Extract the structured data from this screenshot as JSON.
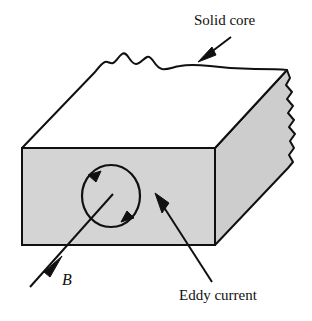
{
  "figure": {
    "name": "eddy-current-in-solid-core",
    "background_color": "#ffffff",
    "width": 312,
    "height": 321
  },
  "labels": {
    "solid_core": "Solid core",
    "eddy_current": "Eddy current",
    "b_field": "B"
  },
  "icons": {
    "solid_core_arrow": "arrow-down-left-icon",
    "eddy_current_arrow": "arrow-up-left-icon",
    "b_field_arrow": "arrow-up-right-icon",
    "eddy_loop_arrow_top": "arrowhead-counterclockwise-icon",
    "eddy_loop_arrow_bottom": "arrowhead-counterclockwise-icon"
  },
  "colors": {
    "stroke": "#101010",
    "face_fill": "#d4d4d4",
    "side_fill": "#cdcdcd",
    "background": "#ffffff"
  },
  "geometry": {
    "front_face": {
      "left": 22,
      "top": 148,
      "right": 215,
      "bottom": 245
    },
    "top_face_back_corner": {
      "x": 287,
      "y": 70
    },
    "eddy_loop": {
      "cx": 111,
      "cy": 196,
      "rx": 29,
      "ry": 31
    },
    "circulation": "counterclockwise"
  }
}
